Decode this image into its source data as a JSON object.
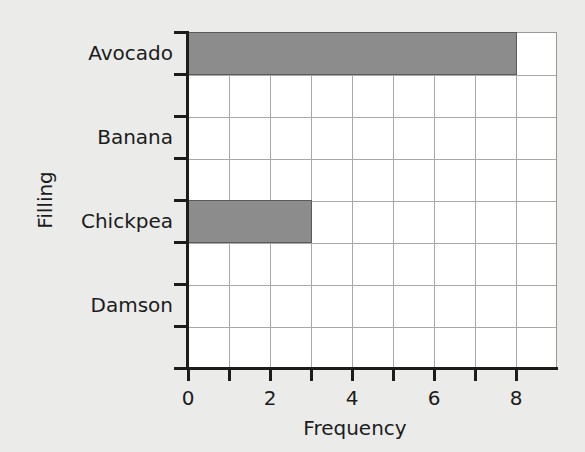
{
  "chart_data": {
    "type": "bar",
    "orientation": "horizontal",
    "title": "",
    "xlabel": "Frequency",
    "ylabel": "Filling",
    "categories": [
      "Avocado",
      "Banana",
      "Chickpea",
      "Damson"
    ],
    "values": [
      8,
      0,
      3,
      0
    ],
    "xlim": [
      0,
      9
    ],
    "xticks": [
      0,
      2,
      4,
      6,
      8
    ],
    "minor_xticks": [
      1,
      3,
      5,
      7
    ],
    "grid": true,
    "legend": null,
    "colors": {
      "bar": "#8c8c8c",
      "bar_edge": "#5a5a5a",
      "plot_bg": "#ffffff",
      "page_bg": "#ebebea",
      "grid": "#a8a8a8",
      "axis": "#1c1c1c"
    }
  },
  "labels": {
    "x_title": "Frequency",
    "y_title": "Filling",
    "categories": [
      "Avocado",
      "Banana",
      "Chickpea",
      "Damson"
    ],
    "x_ticks": [
      "0",
      "2",
      "4",
      "6",
      "8"
    ]
  }
}
